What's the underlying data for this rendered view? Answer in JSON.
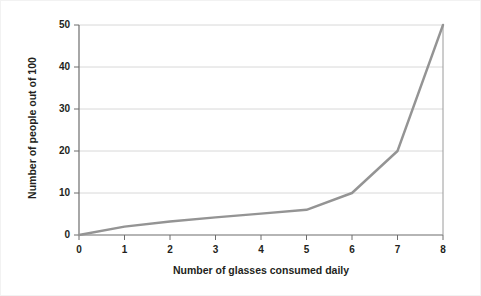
{
  "chart_data": {
    "type": "line",
    "title": "",
    "xlabel": "Number of glasses consumed daily",
    "ylabel": "Number of people out of 100",
    "x": [
      0,
      1,
      2,
      3,
      4,
      5,
      6,
      7,
      8
    ],
    "values": [
      0,
      2,
      3.2,
      4.2,
      5.1,
      6,
      10,
      20,
      50
    ],
    "series": [
      {
        "name": "Number of people out of 100",
        "values": [
          0,
          2,
          3.2,
          4.2,
          5.1,
          6,
          10,
          20,
          50
        ]
      }
    ],
    "xlim": [
      0,
      8
    ],
    "ylim": [
      0,
      50
    ],
    "xticks": [
      "0",
      "1",
      "2",
      "3",
      "4",
      "5",
      "6",
      "7",
      "8"
    ],
    "yticks": [
      "0",
      "10",
      "20",
      "30",
      "40",
      "50"
    ],
    "ytick_values": [
      0,
      10,
      20,
      30,
      40,
      50
    ],
    "grid": "horizontal",
    "legend": "none",
    "line_color": "#949494",
    "grid_color": "#d8d8d8",
    "axis_color": "#6d6d6d",
    "text_color": "#231f20"
  }
}
